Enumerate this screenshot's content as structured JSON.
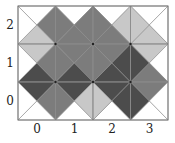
{
  "figure": {
    "columns": 4,
    "rows": 3,
    "x_labels": [
      "0",
      "1",
      "2",
      "3"
    ],
    "y_labels": [
      "0",
      "1",
      "2"
    ],
    "palette": {
      "W": "#ffffff",
      "L": "#c8c8c8",
      "M": "#7c7c7c",
      "D": "#4c4c4c"
    },
    "line_color": "#8a8a8a",
    "border_color": "#777777",
    "cells_order": "top, right, bottom, left",
    "cells": {
      "2": [
        [
          "W",
          "M",
          "L",
          "W"
        ],
        [
          "W",
          "M",
          "M",
          "M"
        ],
        [
          "W",
          "L",
          "M",
          "M"
        ],
        [
          "W",
          "W",
          "L",
          "L"
        ]
      ],
      "1": [
        [
          "L",
          "M",
          "D",
          "W"
        ],
        [
          "M",
          "M",
          "D",
          "M"
        ],
        [
          "M",
          "D",
          "D",
          "M"
        ],
        [
          "L",
          "W",
          "M",
          "D"
        ]
      ],
      "0": [
        [
          "D",
          "M",
          "W",
          "W"
        ],
        [
          "D",
          "L",
          "W",
          "M"
        ],
        [
          "D",
          "D",
          "W",
          "L"
        ],
        [
          "M",
          "W",
          "W",
          "D"
        ]
      ]
    }
  }
}
